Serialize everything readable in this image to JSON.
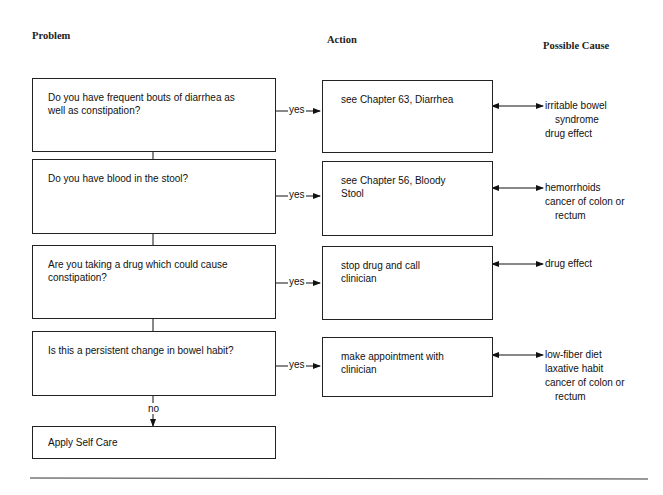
{
  "headers": {
    "problem": "Problem",
    "action": "Action",
    "possible_cause": "Possible Cause"
  },
  "labels": {
    "yes": "yes",
    "no": "no"
  },
  "rows": [
    {
      "problem": [
        "Do you have frequent bouts of diarrhea as",
        "well as constipation?"
      ],
      "action": [
        "see Chapter 63, Diarrhea"
      ],
      "causes": [
        {
          "text": "irritable bowel",
          "indent": false
        },
        {
          "text": "syndrome",
          "indent": true
        },
        {
          "text": "drug effect",
          "indent": false
        }
      ]
    },
    {
      "problem": [
        "Do you have blood in the stool?"
      ],
      "action": [
        "see Chapter 56, Bloody",
        "Stool"
      ],
      "causes": [
        {
          "text": "hemorrhoids",
          "indent": false
        },
        {
          "text": "cancer of colon or",
          "indent": false
        },
        {
          "text": "rectum",
          "indent": true
        }
      ]
    },
    {
      "problem": [
        "Are you taking a drug which could cause",
        "constipation?"
      ],
      "action": [
        "stop drug and call",
        "clinician"
      ],
      "causes": [
        {
          "text": "drug effect",
          "indent": false
        }
      ]
    },
    {
      "problem": [
        "Is this a persistent change in bowel habit?"
      ],
      "action": [
        "make appointment with",
        "clinician"
      ],
      "causes": [
        {
          "text": "low-fiber diet",
          "indent": false
        },
        {
          "text": "laxative habit",
          "indent": false
        },
        {
          "text": "cancer of colon or",
          "indent": false
        },
        {
          "text": "rectum",
          "indent": true
        }
      ]
    }
  ],
  "final": {
    "label": "Apply Self Care"
  }
}
